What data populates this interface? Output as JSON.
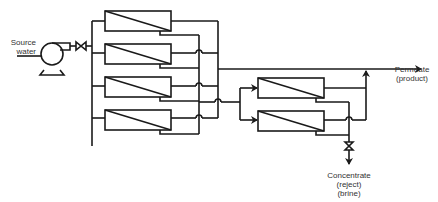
{
  "diagram": {
    "type": "two-stage reverse osmosis (RO) process flow",
    "labels": {
      "source": [
        "Source",
        "water"
      ],
      "permeate": [
        "Permeate",
        "(product)"
      ],
      "concentrate": [
        "Concentrate",
        "(reject)",
        "(brine)"
      ]
    },
    "stage1": {
      "module_count": 4
    },
    "stage2": {
      "module_count": 2
    },
    "components": [
      "pump",
      "valve",
      "membrane modules",
      "concentrate valve"
    ],
    "stroke_color": "#1a1a1a"
  }
}
